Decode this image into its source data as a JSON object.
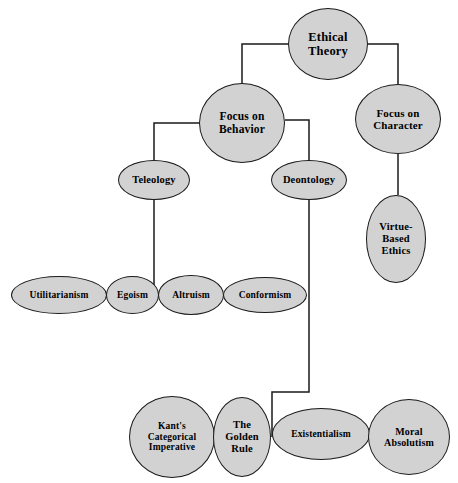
{
  "diagram": {
    "title": "Ethical Theory",
    "type": "hierarchy-tree",
    "background_color": "#ffffff",
    "node_fill_color": "#d2d2d2",
    "node_stroke_color": "#1a1a1a",
    "edge_color": "#1a1a1a",
    "nodes": [
      {
        "id": "ethical-theory",
        "label": "Ethical\nTheory",
        "shape": "circle",
        "x": 288,
        "y": 8,
        "w": 80,
        "h": 72,
        "font_size": 12.5,
        "level": 0
      },
      {
        "id": "focus-on-behavior",
        "label": "Focus on\nBehavior",
        "shape": "circle",
        "x": 199,
        "y": 83,
        "w": 86,
        "h": 80,
        "font_size": 11.5,
        "level": 1
      },
      {
        "id": "focus-on-character",
        "label": "Focus on\nCharacter",
        "shape": "ellipse",
        "x": 355,
        "y": 84,
        "w": 86,
        "h": 70,
        "font_size": 11,
        "level": 1
      },
      {
        "id": "teleology",
        "label": "Teleology",
        "shape": "ellipse",
        "x": 118,
        "y": 160,
        "w": 72,
        "h": 40,
        "font_size": 10.5,
        "level": 2
      },
      {
        "id": "deontology",
        "label": "Deontology",
        "shape": "ellipse",
        "x": 271,
        "y": 160,
        "w": 76,
        "h": 40,
        "font_size": 10.5,
        "level": 2
      },
      {
        "id": "virtue-based-ethics",
        "label": "Virtue-\nBased\nEthics",
        "shape": "ellipse",
        "x": 366,
        "y": 195,
        "w": 60,
        "h": 88,
        "font_size": 10.5,
        "level": 2
      },
      {
        "id": "utilitarianism",
        "label": "Utilitarianism",
        "shape": "ellipse",
        "x": 11,
        "y": 276,
        "w": 96,
        "h": 38,
        "font_size": 9.5,
        "level": 3
      },
      {
        "id": "egoism",
        "label": "Egoism",
        "shape": "ellipse",
        "x": 106,
        "y": 276,
        "w": 53,
        "h": 38,
        "font_size": 9.5,
        "level": 3
      },
      {
        "id": "altruism",
        "label": "Altruism",
        "shape": "ellipse",
        "x": 158,
        "y": 275,
        "w": 66,
        "h": 40,
        "font_size": 9.5,
        "level": 3
      },
      {
        "id": "conformism",
        "label": "Conformism",
        "shape": "ellipse",
        "x": 223,
        "y": 277,
        "w": 84,
        "h": 36,
        "font_size": 9.5,
        "level": 3
      },
      {
        "id": "kants-categorical-imperative",
        "label": "Kant's\nCategorical\nImperative",
        "shape": "circle",
        "x": 129,
        "y": 396,
        "w": 86,
        "h": 82,
        "font_size": 9.5,
        "level": 4
      },
      {
        "id": "the-golden-rule",
        "label": "The\nGolden\nRule",
        "shape": "ellipse",
        "x": 213,
        "y": 397,
        "w": 58,
        "h": 80,
        "font_size": 10.5,
        "level": 4
      },
      {
        "id": "existentialism",
        "label": "Existentialism",
        "shape": "ellipse",
        "x": 272,
        "y": 408,
        "w": 98,
        "h": 52,
        "font_size": 9.5,
        "level": 4
      },
      {
        "id": "moral-absolutism",
        "label": "Moral\nAbsolutism",
        "shape": "ellipse",
        "x": 368,
        "y": 399,
        "w": 82,
        "h": 76,
        "font_size": 10,
        "level": 4
      }
    ],
    "edges": [
      {
        "id": "edge-ethical-theory-focus-behavior",
        "from": "ethical-theory",
        "to": "focus-on-behavior"
      },
      {
        "id": "edge-ethical-theory-focus-character",
        "from": "ethical-theory",
        "to": "focus-on-character"
      },
      {
        "id": "edge-focus-behavior-teleology",
        "from": "focus-on-behavior",
        "to": "teleology"
      },
      {
        "id": "edge-focus-behavior-deontology",
        "from": "focus-on-behavior",
        "to": "deontology"
      },
      {
        "id": "edge-focus-character-virtue",
        "from": "focus-on-character",
        "to": "virtue-based-ethics"
      },
      {
        "id": "edge-teleology-row",
        "from": "teleology",
        "to": "egoism-altruism-junction"
      },
      {
        "id": "edge-utilitarianism-egoism",
        "from": "utilitarianism",
        "to": "egoism"
      },
      {
        "id": "edge-egoism-altruism",
        "from": "egoism",
        "to": "altruism"
      },
      {
        "id": "edge-altruism-conformism",
        "from": "altruism",
        "to": "conformism"
      },
      {
        "id": "edge-deontology-golden-rule",
        "from": "deontology",
        "to": "the-golden-rule"
      },
      {
        "id": "edge-kants-golden-rule",
        "from": "kants-categorical-imperative",
        "to": "the-golden-rule"
      },
      {
        "id": "edge-golden-rule-existentialism",
        "from": "the-golden-rule",
        "to": "existentialism"
      },
      {
        "id": "edge-existentialism-moral-absolutism",
        "from": "existentialism",
        "to": "moral-absolutism"
      }
    ]
  }
}
